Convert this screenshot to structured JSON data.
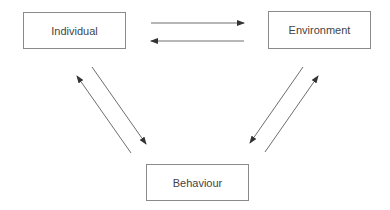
{
  "diagram": {
    "nodes": {
      "individual": "Individual",
      "environment": "Environment",
      "behaviour": "Behaviour"
    },
    "edges": [
      {
        "from": "Individual",
        "to": "Environment"
      },
      {
        "from": "Environment",
        "to": "Individual"
      },
      {
        "from": "Individual",
        "to": "Behaviour"
      },
      {
        "from": "Behaviour",
        "to": "Individual"
      },
      {
        "from": "Environment",
        "to": "Behaviour"
      },
      {
        "from": "Behaviour",
        "to": "Environment"
      }
    ],
    "colors": {
      "line": "#6e6e6e",
      "box_border": "#8a8a8a",
      "text": "#444444"
    }
  }
}
